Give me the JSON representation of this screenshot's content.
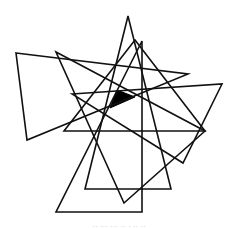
{
  "figure": {
    "width": 238,
    "height": 228,
    "background": "#ffffff",
    "stroke_color": "#111111",
    "stroke_width": 1.6,
    "triangles": [
      {
        "name": "triangle-left-wide",
        "points": [
          [
            16,
            53
          ],
          [
            188,
            74
          ],
          [
            27,
            140
          ]
        ]
      },
      {
        "name": "triangle-top-apex",
        "points": [
          [
            128,
            16
          ],
          [
            171,
            189
          ],
          [
            85,
            189
          ]
        ]
      },
      {
        "name": "triangle-right-angle-bottom",
        "points": [
          [
            142,
            41
          ],
          [
            142,
            212
          ],
          [
            56,
            212
          ]
        ]
      },
      {
        "name": "triangle-diagonal-down",
        "points": [
          [
            56,
            52
          ],
          [
            205,
            131
          ],
          [
            124,
            203
          ]
        ]
      },
      {
        "name": "triangle-flat-base",
        "points": [
          [
            135,
            40
          ],
          [
            205,
            131
          ],
          [
            64,
            131
          ]
        ]
      },
      {
        "name": "triangle-right-wide",
        "points": [
          [
            72,
            94
          ],
          [
            222,
            84
          ],
          [
            183,
            163
          ]
        ]
      }
    ],
    "filled_region": {
      "name": "filled-center-triangle",
      "fill": "#000000",
      "points": [
        [
          117,
          90
        ],
        [
          135,
          97
        ],
        [
          110,
          108
        ]
      ]
    }
  },
  "caption": {
    "text": "·· ··· ··· ·· · ·· ··"
  }
}
